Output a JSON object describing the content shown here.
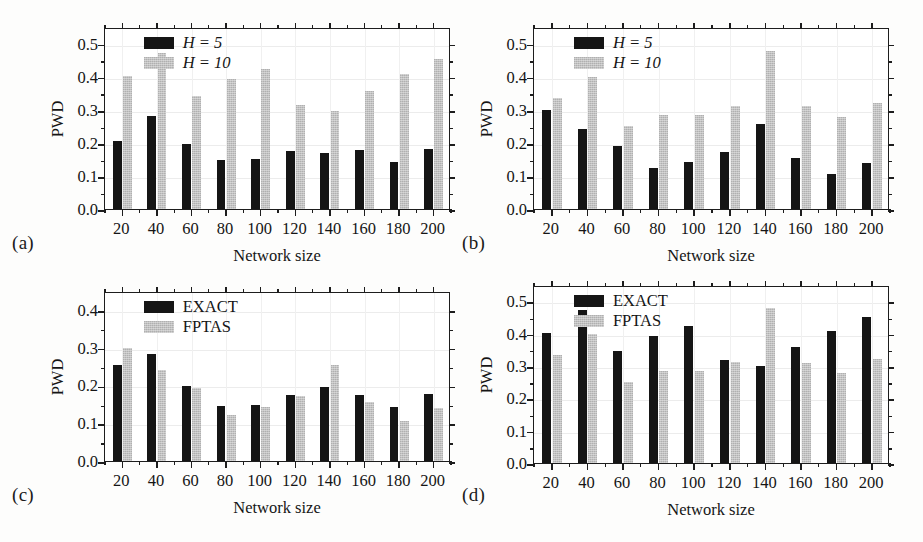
{
  "figure": {
    "background": "#fdfdfc",
    "series_colors": {
      "exact": "#151515",
      "approx": "#b9b9b9"
    }
  },
  "panels": [
    {
      "label": "(a)",
      "chart_data": {
        "type": "bar",
        "title": "",
        "xlabel": "Network size",
        "ylabel": "PWD",
        "categories": [
          "20",
          "40",
          "60",
          "80",
          "100",
          "120",
          "140",
          "160",
          "180",
          "200"
        ],
        "ylim": [
          0.0,
          0.55
        ],
        "yticks": [
          "0.0",
          "0.1",
          "0.2",
          "0.3",
          "0.4",
          "0.5"
        ],
        "ytick_values": [
          0.0,
          0.1,
          0.2,
          0.3,
          0.4,
          0.5
        ],
        "grid": true,
        "legend_position": "top-left",
        "series": [
          {
            "name": "H = 5",
            "italic_lead": true,
            "values": [
              0.205,
              0.281,
              0.197,
              0.148,
              0.15,
              0.175,
              0.168,
              0.178,
              0.143,
              0.18
            ]
          },
          {
            "name": "H = 10",
            "italic_lead": true,
            "values": [
              0.401,
              0.471,
              0.342,
              0.393,
              0.422,
              0.315,
              0.297,
              0.357,
              0.407,
              0.453
            ]
          }
        ]
      }
    },
    {
      "label": "(b)",
      "chart_data": {
        "type": "bar",
        "title": "",
        "xlabel": "Network size",
        "ylabel": "PWD",
        "categories": [
          "20",
          "40",
          "60",
          "80",
          "100",
          "120",
          "140",
          "160",
          "180",
          "200"
        ],
        "ylim": [
          0.0,
          0.55
        ],
        "yticks": [
          "0.0",
          "0.1",
          "0.2",
          "0.3",
          "0.4",
          "0.5"
        ],
        "ytick_values": [
          0.0,
          0.1,
          0.2,
          0.3,
          0.4,
          0.5
        ],
        "grid": true,
        "legend_position": "top-left",
        "series": [
          {
            "name": "H = 5",
            "italic_lead": true,
            "values": [
              0.299,
              0.243,
              0.191,
              0.124,
              0.143,
              0.173,
              0.257,
              0.155,
              0.106,
              0.14
            ]
          },
          {
            "name": "H = 10",
            "italic_lead": true,
            "values": [
              0.335,
              0.399,
              0.25,
              0.284,
              0.283,
              0.312,
              0.479,
              0.31,
              0.278,
              0.321
            ]
          }
        ]
      }
    },
    {
      "label": "(c)",
      "chart_data": {
        "type": "bar",
        "title": "",
        "xlabel": "Network size",
        "ylabel": "PWD",
        "categories": [
          "20",
          "40",
          "60",
          "80",
          "100",
          "120",
          "140",
          "160",
          "180",
          "200"
        ],
        "ylim": [
          0.0,
          0.45
        ],
        "yticks": [
          "0.0",
          "0.1",
          "0.2",
          "0.3",
          "0.4"
        ],
        "ytick_values": [
          0.0,
          0.1,
          0.2,
          0.3,
          0.4
        ],
        "grid": true,
        "legend_position": "top-left",
        "series": [
          {
            "name": "EXACT",
            "italic_lead": false,
            "values": [
              0.255,
              0.282,
              0.198,
              0.146,
              0.149,
              0.174,
              0.196,
              0.175,
              0.144,
              0.178
            ]
          },
          {
            "name": "FPTAS",
            "italic_lead": false,
            "values": [
              0.298,
              0.242,
              0.192,
              0.123,
              0.142,
              0.172,
              0.255,
              0.156,
              0.105,
              0.141
            ]
          }
        ]
      }
    },
    {
      "label": "(d)",
      "chart_data": {
        "type": "bar",
        "title": "",
        "xlabel": "Network size",
        "ylabel": "PWD",
        "categories": [
          "20",
          "40",
          "60",
          "80",
          "100",
          "120",
          "140",
          "160",
          "180",
          "200"
        ],
        "ylim": [
          0.0,
          0.55
        ],
        "yticks": [
          "0.0",
          "0.1",
          "0.2",
          "0.3",
          "0.4",
          "0.5"
        ],
        "ytick_values": [
          0.0,
          0.1,
          0.2,
          0.3,
          0.4,
          0.5
        ],
        "grid": true,
        "legend_position": "top-left",
        "series": [
          {
            "name": "EXACT",
            "italic_lead": false,
            "values": [
              0.402,
              0.473,
              0.345,
              0.393,
              0.423,
              0.317,
              0.299,
              0.359,
              0.407,
              0.452
            ]
          },
          {
            "name": "FPTAS",
            "italic_lead": false,
            "values": [
              0.335,
              0.399,
              0.25,
              0.285,
              0.284,
              0.311,
              0.479,
              0.31,
              0.277,
              0.321
            ]
          }
        ]
      }
    }
  ]
}
